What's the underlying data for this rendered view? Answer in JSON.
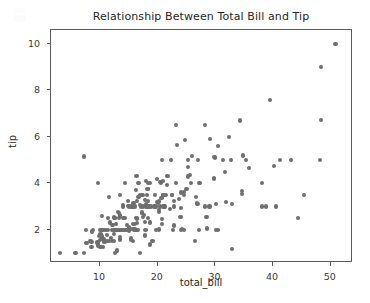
{
  "chart_data": {
    "type": "scatter",
    "title": "Relationship Between Total Bill and Tip",
    "xlabel": "total_bill",
    "ylabel": "tip",
    "xlim": [
      1.5,
      53.5
    ],
    "ylim": [
      0.65,
      10.6
    ],
    "xticks": [
      10,
      20,
      30,
      40,
      50
    ],
    "yticks": [
      2,
      4,
      6,
      8,
      10
    ],
    "grid": false,
    "legend": null,
    "marker": {
      "shape": "circle",
      "color": "#6e6e6e",
      "size_px": 4.2
    },
    "n_points": 244,
    "series": [
      {
        "name": "tips",
        "x": [
          16.99,
          10.34,
          21.01,
          23.68,
          24.59,
          25.29,
          8.77,
          26.88,
          15.04,
          14.78,
          10.27,
          35.26,
          15.42,
          18.43,
          14.83,
          21.58,
          10.33,
          16.29,
          16.97,
          20.65,
          17.92,
          20.29,
          15.77,
          39.42,
          19.82,
          17.81,
          13.37,
          12.69,
          21.7,
          19.65,
          9.55,
          18.35,
          15.06,
          20.69,
          17.78,
          24.06,
          16.31,
          16.93,
          18.69,
          31.27,
          16.04,
          17.46,
          13.94,
          9.68,
          30.4,
          18.29,
          22.23,
          32.4,
          28.55,
          18.04,
          12.54,
          10.29,
          34.81,
          9.94,
          25.56,
          19.49,
          38.01,
          26.41,
          11.24,
          48.27,
          20.29,
          13.81,
          11.02,
          18.29,
          17.59,
          20.08,
          16.45,
          3.07,
          20.23,
          15.01,
          12.02,
          17.07,
          26.86,
          25.28,
          14.73,
          10.51,
          17.92,
          27.2,
          22.76,
          17.29,
          19.44,
          16.66,
          10.07,
          32.68,
          15.98,
          34.83,
          13.03,
          18.28,
          24.71,
          21.16,
          28.97,
          22.49,
          5.75,
          16.32,
          22.75,
          40.17,
          27.28,
          12.03,
          21.01,
          12.46,
          11.35,
          15.38,
          44.3,
          22.42,
          20.92,
          15.36,
          20.49,
          25.21,
          18.24,
          14.31,
          14.0,
          7.25,
          38.07,
          23.95,
          25.71,
          17.31,
          29.93,
          10.65,
          12.43,
          24.08,
          11.69,
          13.42,
          14.26,
          15.95,
          12.48,
          29.8,
          8.52,
          14.52,
          11.38,
          22.82,
          19.08,
          20.27,
          11.17,
          12.26,
          18.26,
          8.51,
          10.33,
          14.15,
          16.0,
          13.16,
          17.47,
          34.3,
          41.19,
          27.05,
          16.43,
          8.35,
          18.64,
          11.87,
          9.78,
          7.51,
          14.07,
          13.13,
          17.26,
          24.55,
          19.77,
          29.85,
          48.17,
          25.0,
          13.39,
          16.49,
          21.5,
          12.66,
          16.21,
          13.81,
          17.51,
          24.52,
          20.76,
          31.71,
          10.59,
          10.63,
          50.81,
          15.81,
          7.25,
          31.85,
          16.82,
          32.9,
          17.89,
          14.48,
          9.6,
          34.63,
          34.65,
          23.33,
          45.35,
          23.17,
          40.55,
          20.69,
          20.9,
          30.46,
          18.15,
          23.1,
          15.69,
          19.81,
          28.44,
          15.48,
          16.58,
          7.56,
          10.34,
          43.11,
          13.0,
          13.51,
          18.71,
          12.74,
          13.0,
          16.4,
          20.53,
          16.47,
          26.59,
          38.73,
          24.27,
          12.76,
          30.06,
          25.89,
          48.33,
          13.27,
          28.17,
          12.9,
          28.15,
          11.59,
          7.74,
          30.14,
          12.16,
          13.42,
          8.58,
          15.98,
          13.42,
          16.27,
          10.09,
          20.45,
          13.28,
          22.12,
          24.01,
          15.69,
          11.61,
          10.77,
          15.53,
          10.07,
          12.6,
          32.83,
          35.83,
          29.03,
          27.18,
          22.67,
          17.82,
          18.78
        ],
        "y": [
          1.01,
          1.66,
          3.5,
          3.31,
          3.61,
          4.71,
          2.0,
          3.12,
          1.96,
          3.23,
          1.71,
          5.0,
          1.57,
          3.0,
          3.02,
          3.92,
          1.67,
          3.71,
          3.5,
          3.35,
          4.08,
          2.75,
          2.23,
          7.58,
          3.18,
          2.34,
          2.0,
          2.0,
          4.3,
          3.0,
          1.45,
          2.5,
          3.0,
          2.45,
          3.27,
          3.6,
          2.0,
          3.07,
          2.31,
          5.0,
          2.24,
          2.54,
          3.06,
          1.32,
          5.6,
          3.0,
          5.0,
          6.0,
          2.05,
          3.0,
          2.5,
          2.6,
          5.2,
          1.56,
          4.34,
          3.51,
          3.0,
          1.5,
          1.76,
          6.73,
          3.21,
          2.0,
          1.98,
          3.76,
          2.64,
          3.15,
          2.47,
          1.0,
          2.01,
          2.09,
          1.97,
          3.0,
          3.14,
          5.0,
          2.2,
          1.25,
          3.08,
          4.0,
          3.0,
          2.71,
          3.0,
          3.4,
          1.83,
          5.0,
          2.03,
          5.17,
          2.0,
          4.0,
          5.85,
          3.0,
          3.0,
          3.5,
          1.0,
          4.3,
          3.25,
          4.73,
          4.0,
          1.5,
          3.0,
          1.5,
          2.5,
          3.0,
          2.5,
          3.48,
          4.08,
          1.64,
          4.06,
          4.29,
          3.76,
          4.0,
          3.0,
          1.0,
          4.0,
          2.55,
          4.0,
          3.5,
          5.07,
          1.5,
          1.8,
          2.92,
          2.31,
          1.68,
          2.5,
          2.0,
          2.52,
          4.2,
          1.48,
          2.0,
          2.0,
          2.18,
          1.5,
          2.83,
          1.5,
          2.0,
          3.25,
          1.25,
          2.0,
          2.0,
          2.0,
          2.75,
          3.5,
          6.7,
          5.0,
          5.0,
          2.3,
          1.5,
          1.36,
          1.63,
          1.73,
          2.0,
          2.5,
          2.0,
          2.74,
          2.0,
          2.0,
          5.14,
          5.0,
          3.75,
          2.61,
          2.0,
          3.5,
          2.5,
          2.0,
          2.0,
          3.0,
          3.48,
          2.24,
          4.5,
          1.61,
          2.0,
          10.0,
          3.16,
          5.15,
          3.18,
          4.0,
          3.11,
          2.0,
          2.0,
          4.0,
          3.55,
          3.68,
          5.65,
          3.5,
          6.5,
          3.0,
          5.0,
          3.5,
          2.0,
          3.5,
          4.0,
          1.5,
          4.19,
          2.56,
          2.02,
          4.0,
          1.44,
          2.0,
          5.0,
          2.0,
          2.0,
          4.0,
          2.0,
          2.0,
          2.5,
          4.0,
          3.23,
          3.41,
          3.0,
          2.03,
          2.23,
          2.0,
          5.16,
          9.0,
          2.5,
          6.5,
          1.1,
          3.0,
          1.5,
          1.44,
          3.09,
          2.2,
          3.48,
          1.92,
          3.0,
          1.58,
          2.5,
          2.0,
          3.0,
          2.72,
          2.88,
          2.0,
          3.0,
          3.39,
          1.47,
          3.0,
          1.25,
          1.0,
          1.17,
          4.67,
          5.92,
          2.0,
          2.0,
          1.75,
          3.0
        ]
      }
    ]
  },
  "figure": {
    "title": "Relationship Between Total Bill and Tip",
    "x_axis_label": "total_bill",
    "y_axis_label": "tip",
    "x_tick_labels": [
      "10",
      "20",
      "30",
      "40",
      "50"
    ],
    "y_tick_labels": [
      "2",
      "4",
      "6",
      "8",
      "10"
    ],
    "colors": {
      "background": "#ffffff",
      "marker": "#6e6e6e",
      "spine": "#5a5a5a",
      "text": "#262626",
      "tick_text": "#3a3a3a"
    }
  }
}
